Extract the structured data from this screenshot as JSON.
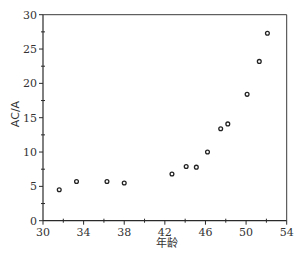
{
  "chart_data": {
    "type": "scatter",
    "title": "",
    "xlabel": "年龄",
    "ylabel": "AC/A",
    "xlim": [
      30,
      54
    ],
    "ylim": [
      0,
      30
    ],
    "xticks": [
      30,
      34,
      38,
      42,
      46,
      50,
      54
    ],
    "yticks": [
      0,
      5,
      10,
      15,
      20,
      25,
      30
    ],
    "grid": false,
    "legend": null,
    "marker": "open-circle",
    "points": [
      {
        "x": 31.6,
        "y": 4.5
      },
      {
        "x": 33.3,
        "y": 5.7
      },
      {
        "x": 36.3,
        "y": 5.7
      },
      {
        "x": 38.0,
        "y": 5.5
      },
      {
        "x": 42.7,
        "y": 6.8
      },
      {
        "x": 44.1,
        "y": 7.9
      },
      {
        "x": 45.1,
        "y": 7.8
      },
      {
        "x": 46.2,
        "y": 10.0
      },
      {
        "x": 47.5,
        "y": 13.4
      },
      {
        "x": 48.2,
        "y": 14.1
      },
      {
        "x": 50.1,
        "y": 18.4
      },
      {
        "x": 51.3,
        "y": 23.2
      },
      {
        "x": 52.1,
        "y": 27.3
      }
    ]
  },
  "axes": {
    "x_title": "年龄",
    "y_title": "AC/A"
  }
}
